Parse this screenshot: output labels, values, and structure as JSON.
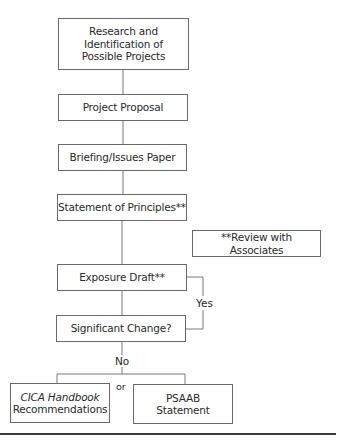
{
  "diagram": {
    "type": "flowchart",
    "nodes": {
      "research": {
        "line1": "Research and",
        "line2": "Identification of",
        "line3": "Possible Projects"
      },
      "proposal": {
        "label": "Project Proposal"
      },
      "briefing": {
        "label": "Briefing/Issues Paper"
      },
      "principles": {
        "label": "Statement of Principles**"
      },
      "review_note": {
        "label": "**Review with Associates"
      },
      "exposure": {
        "label": "Exposure Draft**"
      },
      "significant": {
        "label": "Significant Change?"
      },
      "cica": {
        "line1_italic": "CICA Handbook",
        "line2": "Recommendations"
      },
      "psaab": {
        "line1": "PSAAB",
        "line2": "Statement"
      }
    },
    "edge_labels": {
      "yes": "Yes",
      "no": "No",
      "or": "or"
    },
    "colors": {
      "border": "#6a6a6a",
      "line": "#7a7a7a",
      "text": "#2a2a2a",
      "rule": "#3a3a3a"
    }
  }
}
